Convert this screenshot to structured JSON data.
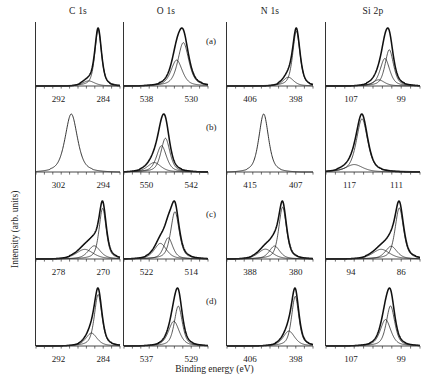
{
  "figure": {
    "ylabel": "Intensity (arb. units)",
    "xlabel": "Binding energy (eV)",
    "columns": [
      {
        "title": "C 1s"
      },
      {
        "title": "O 1s"
      },
      {
        "title": "N 1s"
      },
      {
        "title": "Si 2p"
      }
    ],
    "row_labels": [
      "(a)",
      "(b)",
      "(c)",
      "(d)"
    ],
    "colors": {
      "curve": "#111111",
      "axis": "#333333",
      "text": "#222222"
    }
  },
  "chart_data": {
    "type": "line",
    "title": "",
    "xlabel": "Binding energy (eV)",
    "ylabel": "Intensity (arb. units)",
    "grid": false,
    "legend": false,
    "axis_direction": "reversed",
    "panels": [
      {
        "row": "(a)",
        "column": "C 1s",
        "ticks": [
          292,
          284
        ],
        "xlim": [
          296,
          281
        ],
        "components": [
          {
            "name": "main",
            "center": 284.9,
            "fwhm": 1.4,
            "height": 1.0
          },
          {
            "name": "shoulder",
            "center": 286.6,
            "fwhm": 2.6,
            "height": 0.09
          }
        ]
      },
      {
        "row": "(a)",
        "column": "O 1s",
        "ticks": [
          538,
          530
        ],
        "xlim": [
          542,
          527
        ],
        "components": [
          {
            "name": "main",
            "center": 531.4,
            "fwhm": 2.3,
            "height": 0.92
          },
          {
            "name": "second",
            "center": 532.6,
            "fwhm": 2.4,
            "height": 0.55
          }
        ]
      },
      {
        "row": "(a)",
        "column": "N 1s",
        "ticks": [
          406,
          398
        ],
        "xlim": [
          410,
          395
        ],
        "components": [
          {
            "name": "main",
            "center": 397.9,
            "fwhm": 1.5,
            "height": 1.0
          },
          {
            "name": "shoulder",
            "center": 399.3,
            "fwhm": 2.2,
            "height": 0.16
          }
        ]
      },
      {
        "row": "(a)",
        "column": "Si 2p",
        "ticks": [
          107,
          99
        ],
        "xlim": [
          111,
          96
        ],
        "components": [
          {
            "name": "main",
            "center": 100.9,
            "fwhm": 1.6,
            "height": 1.0
          },
          {
            "name": "second",
            "center": 101.6,
            "fwhm": 1.8,
            "height": 0.76
          },
          {
            "name": "shoulder",
            "center": 102.6,
            "fwhm": 2.2,
            "height": 0.17
          }
        ]
      },
      {
        "row": "(b)",
        "column": "C 1s",
        "ticks": [
          302,
          294
        ],
        "xlim": [
          306,
          291
        ],
        "components": [
          {
            "name": "single",
            "center": 299.7,
            "fwhm": 2.6,
            "height": 1.0
          }
        ]
      },
      {
        "row": "(b)",
        "column": "O 1s",
        "ticks": [
          550,
          542
        ],
        "xlim": [
          554,
          539
        ],
        "components": [
          {
            "name": "main",
            "center": 546.6,
            "fwhm": 1.9,
            "height": 1.0
          },
          {
            "name": "second",
            "center": 547.3,
            "fwhm": 2.1,
            "height": 0.78
          },
          {
            "name": "shoulder",
            "center": 548.6,
            "fwhm": 2.8,
            "height": 0.28
          }
        ]
      },
      {
        "row": "(b)",
        "column": "N 1s",
        "ticks": [
          415,
          407
        ],
        "xlim": [
          419,
          404
        ],
        "components": [
          {
            "name": "single",
            "center": 412.6,
            "fwhm": 2.0,
            "height": 1.0
          }
        ]
      },
      {
        "row": "(b)",
        "column": "Si 2p",
        "ticks": [
          117,
          111
        ],
        "xlim": [
          120,
          108
        ],
        "components": [
          {
            "name": "main",
            "center": 115.4,
            "fwhm": 1.7,
            "height": 1.0
          },
          {
            "name": "shoulder",
            "center": 116.4,
            "fwhm": 2.6,
            "height": 0.14
          }
        ]
      },
      {
        "row": "(c)",
        "column": "C 1s",
        "ticks": [
          278,
          270
        ],
        "xlim": [
          282,
          267
        ],
        "components": [
          {
            "name": "main",
            "center": 270.1,
            "fwhm": 1.5,
            "height": 1.0
          },
          {
            "name": "second",
            "center": 271.6,
            "fwhm": 2.6,
            "height": 0.26
          },
          {
            "name": "third",
            "center": 273.3,
            "fwhm": 3.6,
            "height": 0.19
          }
        ]
      },
      {
        "row": "(c)",
        "column": "O 1s",
        "ticks": [
          522,
          514
        ],
        "xlim": [
          526,
          511
        ],
        "components": [
          {
            "name": "main",
            "center": 516.9,
            "fwhm": 1.8,
            "height": 1.0
          },
          {
            "name": "second",
            "center": 518.1,
            "fwhm": 1.9,
            "height": 0.45
          },
          {
            "name": "third",
            "center": 519.5,
            "fwhm": 2.6,
            "height": 0.33
          }
        ]
      },
      {
        "row": "(c)",
        "column": "N 1s",
        "ticks": [
          388,
          380
        ],
        "xlim": [
          392,
          377
        ],
        "components": [
          {
            "name": "main",
            "center": 382.3,
            "fwhm": 1.6,
            "height": 1.0
          },
          {
            "name": "second",
            "center": 383.7,
            "fwhm": 2.2,
            "height": 0.25
          },
          {
            "name": "third",
            "center": 385.3,
            "fwhm": 3.0,
            "height": 0.19
          }
        ]
      },
      {
        "row": "(c)",
        "column": "Si 2p",
        "ticks": [
          94,
          86
        ],
        "xlim": [
          98,
          83
        ],
        "components": [
          {
            "name": "main",
            "center": 86.3,
            "fwhm": 1.6,
            "height": 1.0
          },
          {
            "name": "second",
            "center": 87.6,
            "fwhm": 2.2,
            "height": 0.25
          },
          {
            "name": "third",
            "center": 89.2,
            "fwhm": 3.2,
            "height": 0.19
          }
        ]
      },
      {
        "row": "(d)",
        "column": "C 1s",
        "ticks": [
          292,
          284
        ],
        "xlim": [
          296,
          281
        ],
        "components": [
          {
            "name": "main",
            "center": 284.9,
            "fwhm": 1.6,
            "height": 1.0
          },
          {
            "name": "shoulder",
            "center": 286.1,
            "fwhm": 2.4,
            "height": 0.25
          }
        ]
      },
      {
        "row": "(d)",
        "column": "O 1s",
        "ticks": [
          537,
          529
        ],
        "xlim": [
          541,
          526
        ],
        "components": [
          {
            "name": "main",
            "center": 531.3,
            "fwhm": 1.7,
            "height": 1.0
          },
          {
            "name": "second",
            "center": 532.1,
            "fwhm": 2.3,
            "height": 0.62
          }
        ]
      },
      {
        "row": "(d)",
        "column": "N 1s",
        "ticks": [
          406,
          398
        ],
        "xlim": [
          410,
          395
        ],
        "components": [
          {
            "name": "main",
            "center": 398.1,
            "fwhm": 1.5,
            "height": 1.0
          },
          {
            "name": "shoulder",
            "center": 399.2,
            "fwhm": 2.4,
            "height": 0.3
          }
        ]
      },
      {
        "row": "(d)",
        "column": "Si 2p",
        "ticks": [
          107,
          99
        ],
        "xlim": [
          111,
          96
        ],
        "components": [
          {
            "name": "main",
            "center": 100.7,
            "fwhm": 1.6,
            "height": 1.0
          },
          {
            "name": "second",
            "center": 101.5,
            "fwhm": 2.0,
            "height": 0.66
          }
        ]
      }
    ]
  }
}
